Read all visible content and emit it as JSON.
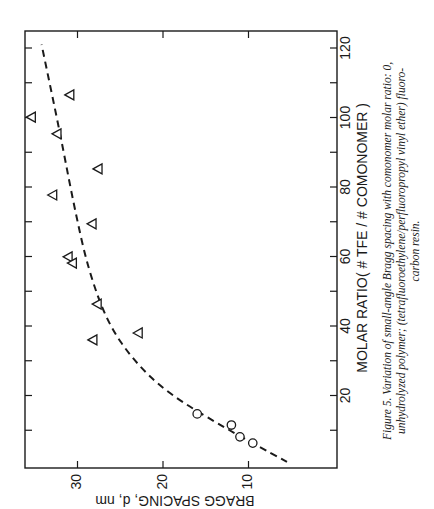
{
  "chart_data": {
    "type": "scatter",
    "orientation_note": "figure printed rotated 90 degrees clockwise",
    "title": "",
    "xlabel": "MOLAR RATIO   ( # TFE / # COMONOMER )",
    "ylabel": "BRAGG SPACING, d, nm",
    "xlim": [
      0,
      124
    ],
    "ylim": [
      0,
      36.3
    ],
    "x_ticks": [
      20,
      40,
      60,
      80,
      100,
      120
    ],
    "y_ticks": [
      10,
      20,
      30
    ],
    "x_minor_tick_step": 10,
    "grid": false,
    "legend": null,
    "series": [
      {
        "name": "unhydrolyzed polymer",
        "marker": "circle",
        "points": [
          {
            "x": 14.7,
            "y": 16.0
          },
          {
            "x": 11.5,
            "y": 12.0
          },
          {
            "x": 8.1,
            "y": 11.0
          },
          {
            "x": 6.3,
            "y": 9.5
          }
        ]
      },
      {
        "name": "(tetrafluoroethylene/perfluoropropyl vinyl ether) fluorocarbon resin",
        "marker": "triangle",
        "points": [
          {
            "x": 106.5,
            "y": 30.9
          },
          {
            "x": 100.1,
            "y": 35.4
          },
          {
            "x": 95.3,
            "y": 32.4
          },
          {
            "x": 85.2,
            "y": 27.6
          },
          {
            "x": 77.7,
            "y": 32.9
          },
          {
            "x": 69.4,
            "y": 28.3
          },
          {
            "x": 59.9,
            "y": 31.1
          },
          {
            "x": 58.1,
            "y": 30.6
          },
          {
            "x": 46.3,
            "y": 27.7
          },
          {
            "x": 38.0,
            "y": 22.9
          },
          {
            "x": 36.0,
            "y": 28.2
          }
        ]
      },
      {
        "name": "fit curve",
        "style": "dashed",
        "points": [
          {
            "x": 0.9,
            "y": 5.5
          },
          {
            "x": 10,
            "y": 12.3
          },
          {
            "x": 20.7,
            "y": 19.5
          },
          {
            "x": 30.2,
            "y": 23.5
          },
          {
            "x": 41,
            "y": 26.5
          },
          {
            "x": 56.7,
            "y": 28.8
          },
          {
            "x": 75.7,
            "y": 30.5
          },
          {
            "x": 95,
            "y": 32.0
          },
          {
            "x": 121,
            "y": 34.2
          }
        ]
      }
    ],
    "annotations": []
  },
  "figure": {
    "x_tick_labels": [
      "20",
      "40",
      "60",
      "80",
      "100",
      "120"
    ],
    "y_tick_labels": [
      "10",
      "20",
      "30"
    ],
    "xlabel_main": "MOLAR RATIO",
    "xlabel_paren": "( # TFE / # COMONOMER )",
    "ylabel": "BRAGG SPACING, d, nm",
    "caption_line1": "Figure 5. Variation of small-angle Bragg spacing with comonomer molar ratio: 0,",
    "caption_line2": "unhydrolyzed polymer; (tetrafluoroethylene/perfluoropropyl vinyl ether) fluoro-",
    "caption_line3": "carbon resin."
  },
  "colors": {
    "ink": "#1a1a1a",
    "background": "#ffffff"
  }
}
